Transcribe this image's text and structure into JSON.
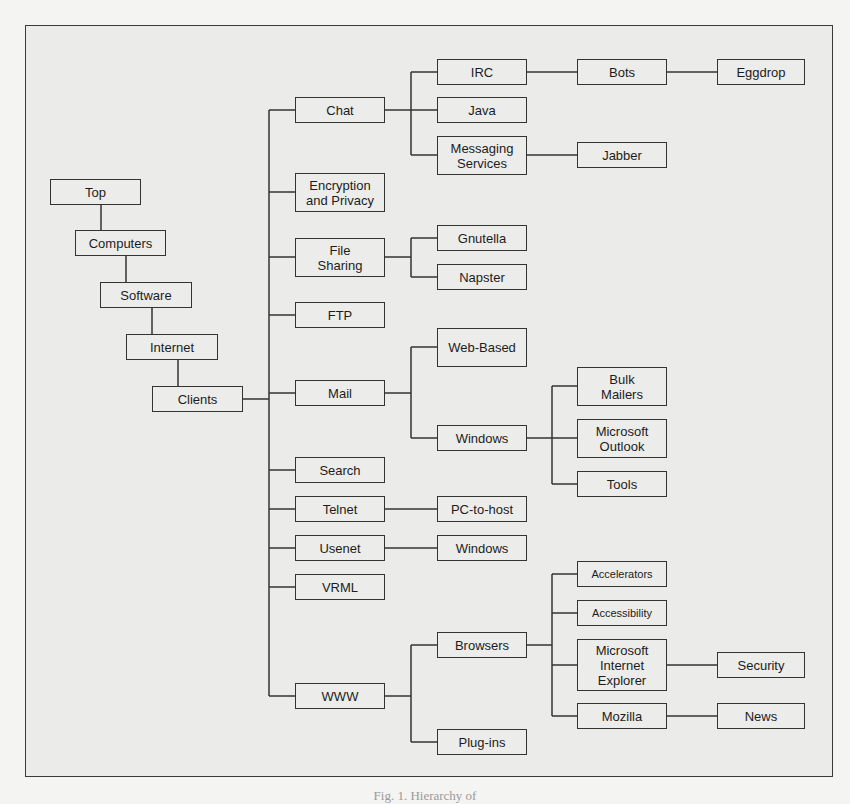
{
  "diagram": {
    "type": "hierarchy-tree",
    "line_color": "#333333",
    "background": "#ebebea",
    "nodes": {
      "top": "Top",
      "computers": "Computers",
      "software": "Software",
      "internet": "Internet",
      "clients": "Clients",
      "chat": "Chat",
      "encryption": "Encryption\nand Privacy",
      "file_sharing": "File\nSharing",
      "ftp": "FTP",
      "mail": "Mail",
      "search": "Search",
      "telnet": "Telnet",
      "usenet": "Usenet",
      "vrml": "VRML",
      "www": "WWW",
      "irc": "IRC",
      "java": "Java",
      "messaging": "Messaging\nServices",
      "gnutella": "Gnutella",
      "napster": "Napster",
      "web_based": "Web-Based",
      "mail_windows": "Windows",
      "pc_to_host": "PC-to-host",
      "usenet_windows": "Windows",
      "browsers": "Browsers",
      "plugins": "Plug-ins",
      "bots": "Bots",
      "jabber": "Jabber",
      "bulk_mailers": "Bulk\nMailers",
      "ms_outlook": "Microsoft\nOutlook",
      "tools": "Tools",
      "accelerators": "Accelerators",
      "accessibility": "Accessibility",
      "msie": "Microsoft\nInternet\nExplorer",
      "mozilla": "Mozilla",
      "eggdrop": "Eggdrop",
      "security": "Security",
      "news": "News"
    },
    "edges": [
      [
        "Top",
        "Computers"
      ],
      [
        "Computers",
        "Software"
      ],
      [
        "Software",
        "Internet"
      ],
      [
        "Internet",
        "Clients"
      ],
      [
        "Clients",
        "Chat"
      ],
      [
        "Clients",
        "Encryption and Privacy"
      ],
      [
        "Clients",
        "File Sharing"
      ],
      [
        "Clients",
        "FTP"
      ],
      [
        "Clients",
        "Mail"
      ],
      [
        "Clients",
        "Search"
      ],
      [
        "Clients",
        "Telnet"
      ],
      [
        "Clients",
        "Usenet"
      ],
      [
        "Clients",
        "VRML"
      ],
      [
        "Clients",
        "WWW"
      ],
      [
        "Chat",
        "IRC"
      ],
      [
        "Chat",
        "Java"
      ],
      [
        "Chat",
        "Messaging Services"
      ],
      [
        "IRC",
        "Bots"
      ],
      [
        "Bots",
        "Eggdrop"
      ],
      [
        "Messaging Services",
        "Jabber"
      ],
      [
        "File Sharing",
        "Gnutella"
      ],
      [
        "File Sharing",
        "Napster"
      ],
      [
        "Mail",
        "Web-Based"
      ],
      [
        "Mail",
        "Windows"
      ],
      [
        "Windows",
        "Bulk Mailers"
      ],
      [
        "Windows",
        "Microsoft Outlook"
      ],
      [
        "Windows",
        "Tools"
      ],
      [
        "Telnet",
        "PC-to-host"
      ],
      [
        "Usenet",
        "Windows"
      ],
      [
        "WWW",
        "Browsers"
      ],
      [
        "WWW",
        "Plug-ins"
      ],
      [
        "Browsers",
        "Accelerators"
      ],
      [
        "Browsers",
        "Accessibility"
      ],
      [
        "Browsers",
        "Microsoft Internet Explorer"
      ],
      [
        "Browsers",
        "Mozilla"
      ],
      [
        "Microsoft Internet Explorer",
        "Security"
      ],
      [
        "Mozilla",
        "News"
      ]
    ]
  },
  "caption": "Fig. 1. Hierarchy of"
}
